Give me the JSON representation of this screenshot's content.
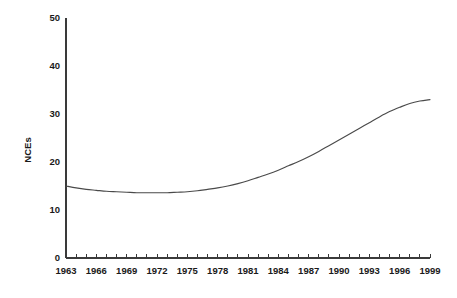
{
  "chart_data": {
    "type": "line",
    "title": "",
    "subtitle": "",
    "xlabel": "",
    "ylabel": "NCEs",
    "xlim": [
      1963,
      1999
    ],
    "ylim": [
      0,
      50
    ],
    "grid": false,
    "legend": false,
    "legend_position": "none",
    "y_ticks": [
      0,
      10,
      20,
      30,
      40,
      50
    ],
    "y_tick_labels": [
      "0",
      "10",
      "20",
      "30",
      "40",
      "50"
    ],
    "x_ticks": [
      1963,
      1964,
      1965,
      1966,
      1967,
      1968,
      1969,
      1970,
      1971,
      1972,
      1973,
      1974,
      1975,
      1976,
      1977,
      1978,
      1979,
      1980,
      1981,
      1982,
      1983,
      1984,
      1985,
      1986,
      1987,
      1988,
      1989,
      1990,
      1991,
      1992,
      1993,
      1994,
      1995,
      1996,
      1997,
      1998,
      1999
    ],
    "x_tick_labels": [
      "1963",
      "1966",
      "1969",
      "1972",
      "1975",
      "1978",
      "1981",
      "1984",
      "1987",
      "1990",
      "1993",
      "1996",
      "1999"
    ],
    "x_label_interval": 3,
    "line_color": "#4a4a4a",
    "axis_color": "#3a3a3a",
    "background_color": "#ffffff",
    "series": [
      {
        "name": "NCEs",
        "x": [
          1963,
          1964,
          1965,
          1966,
          1967,
          1968,
          1969,
          1970,
          1971,
          1972,
          1973,
          1974,
          1975,
          1976,
          1977,
          1978,
          1979,
          1980,
          1981,
          1982,
          1983,
          1984,
          1985,
          1986,
          1987,
          1988,
          1989,
          1990,
          1991,
          1992,
          1993,
          1994,
          1995,
          1996,
          1997,
          1998,
          1999
        ],
        "values": [
          15.0,
          14.6,
          14.3,
          14.1,
          13.9,
          13.8,
          13.7,
          13.6,
          13.6,
          13.6,
          13.6,
          13.7,
          13.8,
          14.0,
          14.3,
          14.6,
          15.0,
          15.5,
          16.1,
          16.8,
          17.5,
          18.3,
          19.2,
          20.1,
          21.1,
          22.2,
          23.4,
          24.6,
          25.8,
          27.0,
          28.2,
          29.4,
          30.5,
          31.4,
          32.2,
          32.7,
          33.0
        ]
      }
    ]
  },
  "axis": {
    "y_title": "NCEs"
  }
}
